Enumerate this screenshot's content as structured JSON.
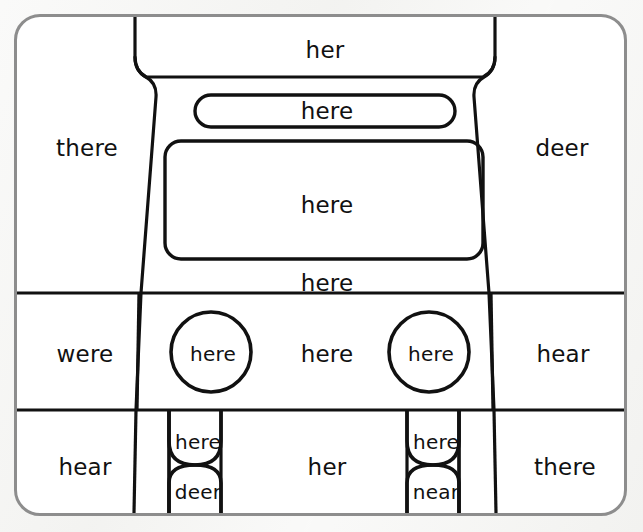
{
  "worksheet": {
    "title": "Sight word coloring page - car",
    "line_color": "#111111",
    "frame_color": "#8d8d8d",
    "background_color": "#f4f4f2",
    "paper_color": "#ffffff"
  },
  "regions": {
    "roof": {
      "label": "her"
    },
    "rear_spoiler": {
      "label": "here"
    },
    "windshield": {
      "label": "here"
    },
    "hood": {
      "label": "here"
    },
    "left_fender_top": {
      "label": "there"
    },
    "right_fender_top": {
      "label": "deer"
    },
    "left_fender_mid": {
      "label": "were"
    },
    "right_fender_mid": {
      "label": "hear"
    },
    "left_headlight": {
      "label": "here"
    },
    "grille": {
      "label": "here"
    },
    "right_headlight": {
      "label": "here"
    },
    "left_fender_bottom": {
      "label": "hear"
    },
    "right_fender_bottom": {
      "label": "there"
    },
    "bumper": {
      "label": "her"
    },
    "left_wheel_top": {
      "label": "here"
    },
    "left_wheel_bottom": {
      "label": "deer"
    },
    "right_wheel_top": {
      "label": "here"
    },
    "right_wheel_bottom": {
      "label": "near"
    }
  },
  "word_list": [
    "her",
    "here",
    "here",
    "here",
    "there",
    "deer",
    "were",
    "here",
    "here",
    "here",
    "hear",
    "hear",
    "here",
    "deer",
    "her",
    "here",
    "near",
    "there"
  ]
}
